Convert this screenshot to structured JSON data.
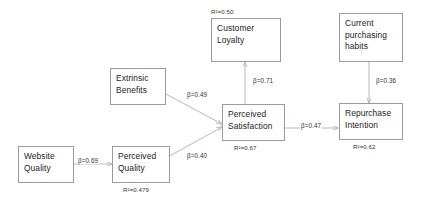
{
  "diagram": {
    "type": "path-model",
    "title": "",
    "nodes": [
      {
        "id": "customer_loyalty",
        "label_lines": [
          "Customer",
          "Loyalty"
        ],
        "r2": "R²=0.50",
        "r2_position": "above"
      },
      {
        "id": "current_habits",
        "label_lines": [
          "Current",
          "purchasing",
          "habits"
        ],
        "r2": "",
        "r2_position": "none"
      },
      {
        "id": "extrinsic_benefits",
        "label_lines": [
          "Extrinsic",
          "Benefits"
        ],
        "r2": "",
        "r2_position": "none"
      },
      {
        "id": "perceived_satisfaction",
        "label_lines": [
          "Perceived",
          "Satisfaction"
        ],
        "r2": "R²=0.67",
        "r2_position": "below"
      },
      {
        "id": "repurchase_intention",
        "label_lines": [
          "Repurchase",
          "Intention"
        ],
        "r2": "R²=0.62",
        "r2_position": "below"
      },
      {
        "id": "website_quality",
        "label_lines": [
          "Website",
          "Quality"
        ],
        "r2": "",
        "r2_position": "none"
      },
      {
        "id": "perceived_quality",
        "label_lines": [
          "Perceived",
          "Quality"
        ],
        "r2": "R²=0.479",
        "r2_position": "below"
      }
    ],
    "edges": [
      {
        "id": "sat_to_loyalty",
        "from": "perceived_satisfaction",
        "to": "customer_loyalty",
        "label": "β=0.71"
      },
      {
        "id": "habits_to_repurchase",
        "from": "current_habits",
        "to": "repurchase_intention",
        "label": "β=0.36"
      },
      {
        "id": "benefits_to_sat",
        "from": "extrinsic_benefits",
        "to": "perceived_satisfaction",
        "label": "β=0.49"
      },
      {
        "id": "sat_to_repurchase",
        "from": "perceived_satisfaction",
        "to": "repurchase_intention",
        "label": "β=0.47"
      },
      {
        "id": "quality_to_sat",
        "from": "perceived_quality",
        "to": "perceived_satisfaction",
        "label": "β=0.40"
      },
      {
        "id": "website_to_quality",
        "from": "website_quality",
        "to": "perceived_quality",
        "label": "β=0.69"
      }
    ],
    "colors": {
      "box_border": "#9b9b9b",
      "edge_line": "#b0b0b0",
      "text": "#1a1a1a",
      "background": "#ffffff"
    }
  }
}
